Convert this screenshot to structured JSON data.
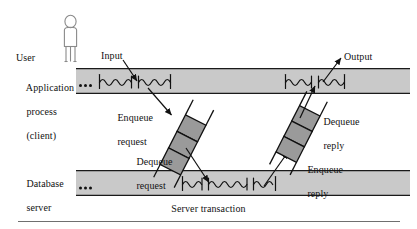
{
  "figure": {
    "colors": {
      "band_fill": "#c9c9c9",
      "band_stroke": "#1a1a1a",
      "queue_cell_fill": "#9a9a9a",
      "queue_cell_stroke": "#1a1a1a",
      "line": "#1a1a1a",
      "person_stroke": "#7a7a7a",
      "rule": "#6f6f6f",
      "background": "#ffffff",
      "text": "#111111"
    }
  },
  "labels": {
    "user": "User",
    "application_process_line1": "Application",
    "application_process_line2": "process",
    "application_process_line3": "(client)",
    "database_server_line1": "Database",
    "database_server_line2": "server",
    "input": "Input",
    "output": "Output",
    "enqueue_request_line1": "Enqueue",
    "enqueue_request_line2": "request",
    "dequeue_request_line1": "Dequeue",
    "dequeue_request_line2": "request",
    "dequeue_reply_line1": "Dequeue",
    "dequeue_reply_line2": "reply",
    "enqueue_reply_line1": "Enqueue",
    "enqueue_reply_line2": "reply",
    "server_transaction": "Server transaction"
  },
  "icons": {
    "person": "person-icon",
    "ellipsis_client": "ellipsis-icon",
    "ellipsis_server": "ellipsis-icon"
  },
  "bands": {
    "client": {
      "x": 76,
      "y": 68,
      "width": 334,
      "height": 26
    },
    "server": {
      "x": 76,
      "y": 170,
      "width": 334,
      "height": 26
    }
  },
  "queues": {
    "request_queue": {
      "cells": 3,
      "label_top": "Enqueue request",
      "label_bottom": "Dequeue request"
    },
    "reply_queue": {
      "cells": 3,
      "label_top": "Dequeue reply",
      "label_bottom": "Enqueue reply"
    }
  }
}
